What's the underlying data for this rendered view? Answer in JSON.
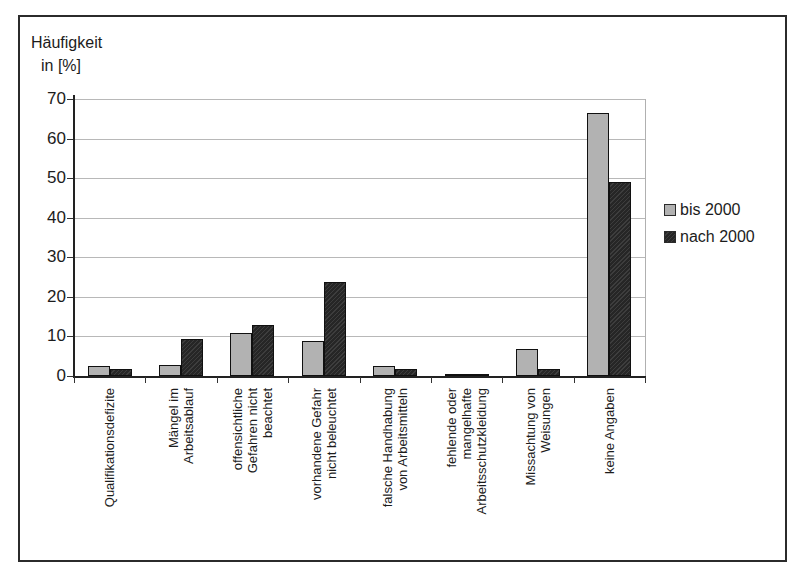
{
  "figure": {
    "frame_color": "#2b2b2b",
    "background": "#ffffff"
  },
  "chart_data": {
    "type": "bar",
    "title": "Häufigkeit in [%]",
    "ylabel_line1": "Häufigkeit",
    "ylabel_line2": "in [%]",
    "xlabel": "",
    "ylim": [
      0,
      70
    ],
    "ytick_step": 10,
    "grid": true,
    "legend_position": "right",
    "categories": [
      "Qualifikationsdefizite",
      "Mängel im Arbeitsablauf",
      "offensichtliche Gefahren nicht beachtet",
      "vorhandene Gefahr nicht beleuchtet",
      "falsche Handhabung von Arbeitsmitteln",
      "fehlende oder mangelhafte Arbeitsschutzkleidung",
      "Missachtung von Weisungen",
      "keine Angaben"
    ],
    "categories_lines": [
      [
        "Qualifikationsdefizite"
      ],
      [
        "Mängel im",
        "Arbeitsablauf"
      ],
      [
        "offensichtliche",
        "Gefahren nicht",
        "beachtet"
      ],
      [
        "vorhandene Gefahr",
        "nicht beleuchtet"
      ],
      [
        "falsche Handhabung",
        "von Arbeitsmitteln"
      ],
      [
        "fehlende oder",
        "mangelhafte",
        "Arbeitsschutzkleidung"
      ],
      [
        "Missachtung von",
        "Weisungen"
      ],
      [
        "keine Angaben"
      ]
    ],
    "series": [
      {
        "name": "bis 2000",
        "color": "#b2b2b2",
        "values": [
          2.5,
          2.9,
          10.9,
          8.8,
          2.6,
          0.5,
          6.9,
          66.4
        ]
      },
      {
        "name": "nach 2000",
        "color": "#333333",
        "values": [
          1.8,
          9.3,
          12.9,
          23.7,
          1.8,
          0.5,
          1.8,
          49.0
        ]
      }
    ]
  }
}
